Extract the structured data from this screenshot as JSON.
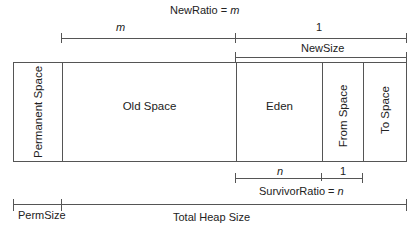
{
  "diagram": {
    "top_labels": {
      "new_ratio": "NewRatio = m",
      "new_ratio_prefix": "NewRatio = ",
      "new_ratio_var": "m",
      "old_portion": "m",
      "new_portion": "1",
      "new_size": "NewSize"
    },
    "regions": [
      {
        "name": "Permanent Space",
        "orientation": "vertical"
      },
      {
        "name": "Old Space",
        "orientation": "horizontal"
      },
      {
        "name": "Eden",
        "orientation": "horizontal"
      },
      {
        "name": "From Space",
        "orientation": "vertical"
      },
      {
        "name": "To Space",
        "orientation": "vertical"
      }
    ],
    "bottom_labels": {
      "eden_portion": "n",
      "survivor_portion": "1",
      "survivor_ratio_prefix": "SurvivorRatio = ",
      "survivor_ratio_var": "n",
      "perm_size": "PermSize",
      "total_heap_size": "Total Heap Size"
    }
  }
}
